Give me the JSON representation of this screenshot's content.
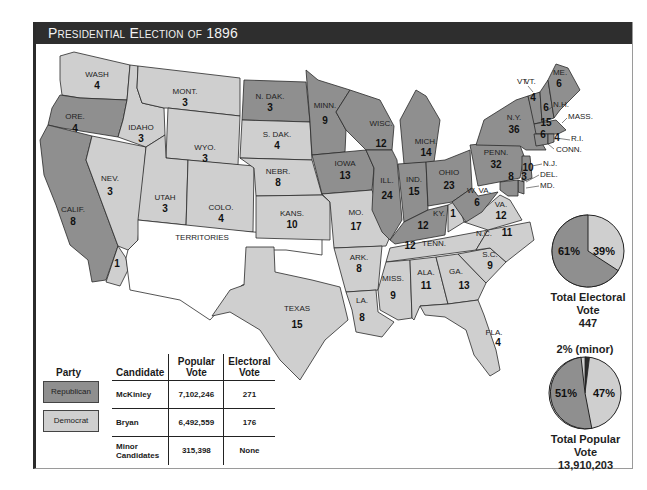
{
  "title": "Presidential Election of 1896",
  "colors": {
    "republican": "#8f8f8f",
    "democrat": "#cfcfcf",
    "territories": "#ffffff",
    "minor": "#2a2a2a",
    "title_bar": "#2e2e2e"
  },
  "map": {
    "territories_label": "TERRITORIES",
    "states": [
      {
        "abbr": "WASH",
        "votes": "4",
        "party": "democrat"
      },
      {
        "abbr": "ORE.",
        "votes": "4",
        "party": "republican"
      },
      {
        "abbr": "CALIF.",
        "votes": "8",
        "party": "republican"
      },
      {
        "abbr": "CALIF. (split)",
        "votes": "1",
        "party": "democrat"
      },
      {
        "abbr": "NEV.",
        "votes": "3",
        "party": "democrat"
      },
      {
        "abbr": "IDAHO",
        "votes": "3",
        "party": "democrat"
      },
      {
        "abbr": "MONT.",
        "votes": "3",
        "party": "democrat"
      },
      {
        "abbr": "WYO.",
        "votes": "3",
        "party": "democrat"
      },
      {
        "abbr": "UTAH",
        "votes": "3",
        "party": "democrat"
      },
      {
        "abbr": "COLO.",
        "votes": "4",
        "party": "democrat"
      },
      {
        "abbr": "N. DAK.",
        "votes": "3",
        "party": "republican"
      },
      {
        "abbr": "S. DAK.",
        "votes": "4",
        "party": "democrat"
      },
      {
        "abbr": "NEBR.",
        "votes": "8",
        "party": "democrat"
      },
      {
        "abbr": "KANS.",
        "votes": "10",
        "party": "democrat"
      },
      {
        "abbr": "TEXAS",
        "votes": "15",
        "party": "democrat"
      },
      {
        "abbr": "MINN.",
        "votes": "9",
        "party": "republican"
      },
      {
        "abbr": "IOWA",
        "votes": "13",
        "party": "republican"
      },
      {
        "abbr": "MO.",
        "votes": "17",
        "party": "democrat"
      },
      {
        "abbr": "ARK.",
        "votes": "8",
        "party": "democrat"
      },
      {
        "abbr": "LA.",
        "votes": "8",
        "party": "democrat"
      },
      {
        "abbr": "WISC.",
        "votes": "12",
        "party": "republican"
      },
      {
        "abbr": "ILL.",
        "votes": "24",
        "party": "republican"
      },
      {
        "abbr": "MICH.",
        "votes": "14",
        "party": "republican"
      },
      {
        "abbr": "IND.",
        "votes": "15",
        "party": "republican"
      },
      {
        "abbr": "OHIO",
        "votes": "23",
        "party": "republican"
      },
      {
        "abbr": "KY.",
        "votes": "12",
        "party": "republican"
      },
      {
        "abbr": "KY. (split)",
        "votes": "1",
        "party": "democrat"
      },
      {
        "abbr": "TENN.",
        "votes": "12",
        "party": "democrat"
      },
      {
        "abbr": "MISS.",
        "votes": "9",
        "party": "democrat"
      },
      {
        "abbr": "ALA.",
        "votes": "11",
        "party": "democrat"
      },
      {
        "abbr": "GA.",
        "votes": "13",
        "party": "democrat"
      },
      {
        "abbr": "FLA.",
        "votes": "4",
        "party": "democrat"
      },
      {
        "abbr": "S.C.",
        "votes": "9",
        "party": "democrat"
      },
      {
        "abbr": "N.C.",
        "votes": "11",
        "party": "democrat"
      },
      {
        "abbr": "VA.",
        "votes": "12",
        "party": "democrat"
      },
      {
        "abbr": "W. VA.",
        "votes": "6",
        "party": "republican"
      },
      {
        "abbr": "PENN.",
        "votes": "32",
        "party": "republican"
      },
      {
        "abbr": "N.Y.",
        "votes": "36",
        "party": "republican"
      },
      {
        "abbr": "VT.",
        "votes": "4",
        "party": "republican"
      },
      {
        "abbr": "N.H.",
        "votes": "4",
        "party": "republican"
      },
      {
        "abbr": "ME.",
        "votes": "6",
        "party": "republican"
      },
      {
        "abbr": "MASS.",
        "votes": "15",
        "party": "republican"
      },
      {
        "abbr": "CONN.",
        "votes": "6",
        "party": "republican"
      },
      {
        "abbr": "R.I.",
        "votes": "4",
        "party": "republican"
      },
      {
        "abbr": "N.J.",
        "votes": "10",
        "party": "republican"
      },
      {
        "abbr": "DEL.",
        "votes": "3",
        "party": "republican"
      },
      {
        "abbr": "MD.",
        "votes": "8",
        "party": "republican"
      }
    ],
    "callouts": [
      "VT.",
      "N.H.",
      "MASS.",
      "R.I.",
      "CONN.",
      "N.J.",
      "DEL.",
      "MD."
    ]
  },
  "electoral_pie": {
    "slices": [
      {
        "label": "61%",
        "party": "republican",
        "value": 61
      },
      {
        "label": "39%",
        "party": "democrat",
        "value": 39
      }
    ],
    "caption": "Total Electoral Vote",
    "total": "447"
  },
  "popular_pie": {
    "slices": [
      {
        "label": "51%",
        "party": "republican",
        "value": 51
      },
      {
        "label": "47%",
        "party": "democrat",
        "value": 47
      },
      {
        "label": "2% (minor)",
        "party": "minor",
        "value": 2
      }
    ],
    "caption": "Total Popular Vote",
    "total": "13,910,203"
  },
  "legend": {
    "party_header": "Party",
    "parties": [
      {
        "name": "Republican"
      },
      {
        "name": "Democrat"
      }
    ],
    "columns": [
      "Candidate",
      "Popular Vote",
      "Electoral Vote"
    ],
    "col_pop_line1": "Popular",
    "col_pop_line2": "Vote",
    "col_el_line1": "Electoral",
    "col_el_line2": "Vote",
    "rows": [
      {
        "candidate": "McKinley",
        "popular": "7,102,246",
        "electoral": "271"
      },
      {
        "candidate": "Bryan",
        "popular": "6,492,559",
        "electoral": "176"
      },
      {
        "candidate_line1": "Minor",
        "candidate_line2": "Candidates",
        "popular": "315,398",
        "electoral": "None"
      }
    ]
  }
}
